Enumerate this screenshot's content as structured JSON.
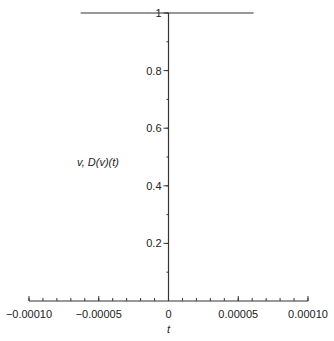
{
  "chart_data": {
    "type": "line",
    "title": "",
    "xlabel": "t",
    "ylabel": "v, D(v)(t)",
    "xlim": [
      -0.0001,
      0.0001
    ],
    "ylim": [
      0,
      1
    ],
    "grid": false,
    "legend": null,
    "x_ticks": [
      -0.0001,
      -5e-05,
      0,
      5e-05,
      0.0001
    ],
    "x_tick_labels": [
      "−0.00010",
      "−0.00005",
      "0",
      "0.00005",
      "0.00010"
    ],
    "x_minor_step": 1e-05,
    "y_ticks": [
      0.2,
      0.4,
      0.6,
      0.8,
      1
    ],
    "y_tick_labels": [
      "0.2",
      "0.4",
      "0.6",
      "0.8",
      "1"
    ],
    "y_minor_step": 0.1,
    "series": [
      {
        "name": "v",
        "description": "constant value 1",
        "x": [
          -6.3e-05,
          6.1e-05
        ],
        "y": [
          1,
          1
        ]
      },
      {
        "name": "D(v)(t)",
        "description": "vertical spike at t = 0",
        "x": [
          0,
          0
        ],
        "y": [
          0,
          1
        ]
      }
    ]
  },
  "colors": {
    "line": "#333333",
    "axis": "#333333",
    "text": "#222222"
  }
}
